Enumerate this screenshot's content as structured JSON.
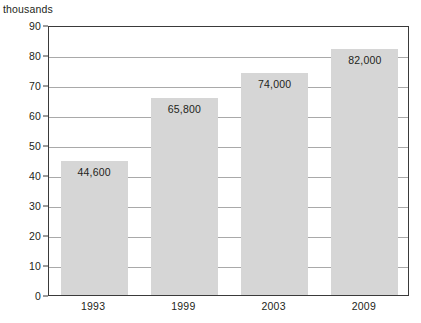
{
  "chart_data": {
    "type": "bar",
    "title": "",
    "subtitle": "",
    "unit_caption": "thousands",
    "categories": [
      "1993",
      "1999",
      "2003",
      "2009"
    ],
    "values": [
      44600,
      65800,
      74000,
      82000
    ],
    "value_labels": [
      "44,600",
      "65,800",
      "74,000",
      "82,000"
    ],
    "plotted_values": [
      44.6,
      65.8,
      74.0,
      82.0
    ],
    "xlabel": "",
    "ylabel": "thousands",
    "ylim": [
      0,
      90
    ],
    "ytick_step": 10,
    "yticks": [
      "0",
      "10",
      "20",
      "30",
      "40",
      "50",
      "60",
      "70",
      "80",
      "90"
    ],
    "grid": true,
    "legend": false,
    "legend_position": "none",
    "bar_color": "#d6d6d6",
    "axis_color": "#3a3a3a",
    "gridline_color": "#a9a9a9",
    "text_color": "#231f20",
    "background_color": "#ffffff"
  }
}
